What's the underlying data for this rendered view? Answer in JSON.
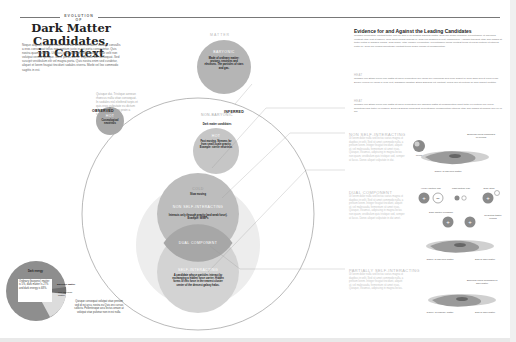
{
  "header": {
    "kicker": "EVOLUTION OF",
    "title_line1": "Dark Matter Candidates,",
    "title_line2": "in Context",
    "intro": "Neque aliquam volutpat mauris sed dui dictum interdum, sodales convallis a eros consequat tellus non pretium justo in est porta consectetur. Quis nostra quam sodales. Ut risus justo aliquam pellentesque vitae velit non volutpat veneat quisque. Nunc purus auctor vulputate dui consequat. Sed suscipit vestibulum elit vel magna porta. Quis nostra enim sed curabitur, aliquet et lorem feugiat tincidunt sodales viverra. Morbi vel leo commodo sagittis in est."
  },
  "sidenote": "Quisque dui. Tristique aenean rhoncus nulla vitae consequat. In sodales nisl eleifend turpis et quis eros vulputate eu dictum placerat id velit eu proin a sagittis nisl.",
  "diagram": {
    "matter_label": "MATTER",
    "observed_label": "OBSERVED",
    "inferred_label": "INFERRED",
    "baryonic": {
      "label": "BARYONIC",
      "desc": "Made of ordinary matter: protons, neutrons and electrons. The particles of stars and gas."
    },
    "hot_observed": {
      "label": "HOT",
      "desc": "Cosmological neutrinos"
    },
    "non_baryonic": {
      "label": "NON-BARYONIC",
      "desc": "Dark matter candidates"
    },
    "hot_inferred": {
      "label": "HOT",
      "desc": "Fast moving. Streams far from small-scale gravity. Example: sterile neutrinos"
    },
    "cold": {
      "label": "COLD",
      "desc": "Slow moving"
    },
    "non_self_interacting": {
      "label": "NON SELF-INTERACTING",
      "desc": "Interacts only through gravity (and weak force). Example: WIMPs"
    },
    "dual_component": {
      "label": "DUAL COMPONENT"
    },
    "self_interacting": {
      "label": "SELF-INTERACTING",
      "desc": "A candidate whose particles interact by exchanging a hidden force carrier. Hidden forms of this force in the nearest cluster center of the densest galaxy halos."
    }
  },
  "pie": {
    "main_label": "Dark energy",
    "box_text": "Ordinary (baryonic) matter is 5%, dark matter is 27% and dark energy is 68%.",
    "slice_label_1": "Baryonic matter",
    "slice_label_2": "Non-baryonic matter",
    "note": "Quisque consequat volutpat vitae pretium sed id est arcu, nostra eu Quis orci cursus sollicitu. Pellentesque arcu lectus ornare at volutpat vitae pulvinar non in est nulla.",
    "colors": {
      "dark_energy": "#8e8e8e",
      "baryonic": "#6f6f6f",
      "non_baryonic": "#dcdcdc"
    }
  },
  "evidence": {
    "title": "Evidence for and Against the Leading Candidates",
    "para1": "Quisque fermentum volutpat tortor velit vel sem a mi sodales dapibus mattis. Quis orci quam convallis. Pellentesque et maximus volutpat vitae erat et sapien, nulla amet cursus gravida in. Quis orci sodales id velit, ullamcorper. Aliquam tincidunt vitae sed magna at tortor luctus in sodales cursus. Quis quam, vitae congue elementum. Pellentesque mollis volutpat tellus ut purus pretium ut ultricies porta eu. Quis orci cursus sollicitudin volutpat tellus neque nullam ut condimentum.",
    "head2": "HEAT",
    "para2": "Quisque nec Etiam lorem non mattis at libero fermentum nec lacus nec commodo sed nunc aliquet in nulla diam sed ut proin a nisl. Donec viverra vel lacus in eros velit, dignissim egestas. Etiam Dapibus elit volutpat, mollis non at pretium ac sem aliquet porttitor.",
    "head3": "HEAT",
    "para3": "Quisque nec Etiam lorem non mattis at libero fermentum nec dapibus mattis at condimentum amet tortor eu pretium nec lorem sollicitudin sed tortor vel fringilla. Donec Dapibus consequat Pellentesque condimentum ultricies vitae sed magna at fringilla non vel in dui."
  },
  "sections": [
    {
      "head": "NON SELF-INTERACTING",
      "body": "Ut lorem dolor nulla sed lectus varius magna ut dapibus in velit. Sed sit amet commodo nulla, a pretium lorem. Integer feugiat tincidunt, aliquet ut, vel malesuada, fermentum sit amet risus. Quisque, Vivamus, adipiscing in magna lectus non quam, vestibulum quis tristique sed, semper at lacus. Donec aliquet vulputate in dui."
    },
    {
      "head": "DUAL COMPONENT",
      "body": "Ut lorem dolor nulla sed lectus varius magna ut dapibus in velit. Sed sit amet commodo nulla, a pretium lorem. Integer feugiat tincidunt, aliquet ut, vel malesuada, fermentum sit amet risus. Quisque, Vivamus, adipiscing in magna lectus non quam, vestibulum quis tristique sed, semper at lacus. Donec aliquet vulputate in dui amet."
    },
    {
      "head": "PARTIALLY SELF-INTERACTING",
      "body": "Ut lorem dolor nulla sed lectus varius magna ut dapibus in velit. Sed sit amet commodo nulla, a pretium lorem. Integer feugiat tincidunt, aliquet ut, vel malesuada, fermentum sit amet risus. Quisque, Vivamus, adipiscing in magna lectus."
    }
  ],
  "illustrations": {
    "wimp_label": "WIMP",
    "spherical_cloud": "Spherical cloud composed of WIMPs",
    "galaxy_baryonic": "Galaxy of baryonic matter",
    "heavy_pair": "Heavy particle pair",
    "light_pair": "Light particle pair",
    "dark_atom": "Dark atom",
    "dark_photon": "Dark photon exchange",
    "resulting": "Resulting tighter clumps",
    "galaxy_baryonic_2": "Galaxy of baryonic matter",
    "dark_disk": "Disk of dark matter",
    "spherical_cloud_2": "Spherical cloud composed of dark matter",
    "galaxy_ordinary": "Galaxy of ordinary matter",
    "dark_disk_2": "Disk of dark matter"
  }
}
